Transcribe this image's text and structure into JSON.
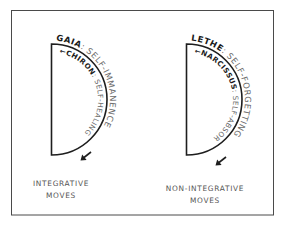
{
  "diagram": {
    "left": {
      "caption_line1": "INTEGRATIVE",
      "caption_line2": "MOVES",
      "outer_name": "GAIA",
      "outer_desc": ": SELF-IMMANENCE",
      "inner_arrow": "←",
      "inner_name": "CHIRON",
      "inner_desc": ": SELF-HEALING"
    },
    "right": {
      "caption_line1": "NON-INTEGRATIVE",
      "caption_line2": "MOVES",
      "outer_name": "LETHE",
      "outer_desc": ": SELF-FORGETTING",
      "inner_arrow": "←",
      "inner_name": "NARCISSUS",
      "inner_desc": ": SELF-ABSORPTION"
    },
    "colors": {
      "line": "#1e1e1e",
      "name_text": "#1a1a1a",
      "desc_text": "#6a6a6a",
      "caption_text": "#555555",
      "frame": "#4a4a4a"
    }
  }
}
